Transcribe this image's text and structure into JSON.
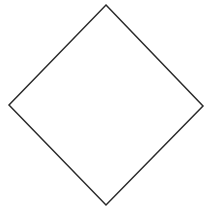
{
  "diagram": {
    "shape": "diamond",
    "vertices": {
      "top": [
        106,
        5
      ],
      "right": [
        203,
        106
      ],
      "bottom": [
        106,
        205
      ],
      "left": [
        9,
        105
      ]
    },
    "stroke_color": "#2b2b2b",
    "fill_color": "#ffffff",
    "stroke_width": 1.5
  }
}
